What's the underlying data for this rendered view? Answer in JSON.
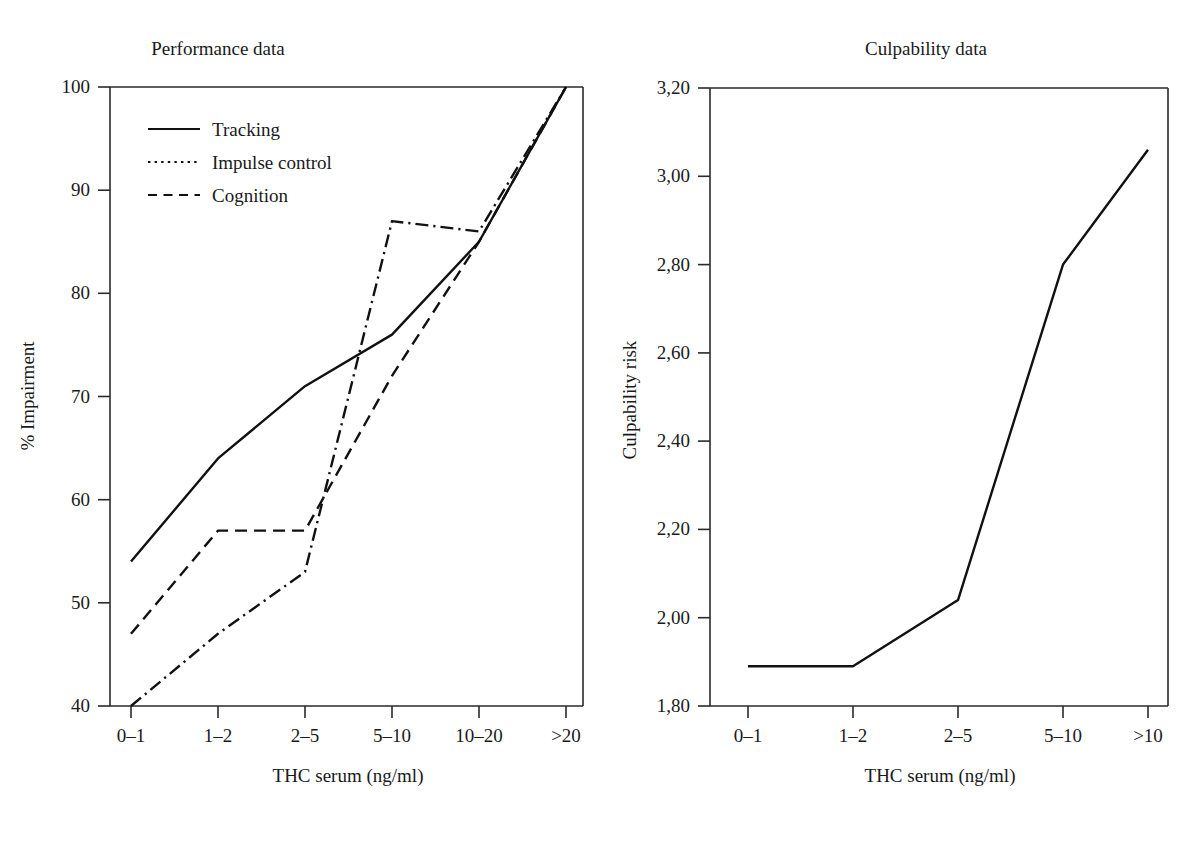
{
  "figure": {
    "cutoff_caption": "",
    "panels": [
      {
        "id": "performance",
        "title": "Performance data",
        "xlabel": "THC serum (ng/ml)",
        "ylabel": "% Impairment"
      },
      {
        "id": "culpability",
        "title": "Culpability data",
        "xlabel": "THC serum (ng/ml)",
        "ylabel": "Culpability risk"
      }
    ]
  },
  "legend": {
    "items": [
      {
        "label": "Tracking",
        "style": "solid"
      },
      {
        "label": "Impulse control",
        "style": "dotted"
      },
      {
        "label": "Cognition",
        "style": "dashed"
      }
    ]
  },
  "left_axis": {
    "y_ticks": [
      "40",
      "50",
      "60",
      "70",
      "80",
      "90",
      "100"
    ],
    "x_ticks": [
      "0–1",
      "1–2",
      "2–5",
      "5–10",
      "10–20",
      ">20"
    ]
  },
  "right_axis": {
    "y_ticks": [
      "1,80",
      "2,00",
      "2,20",
      "2,40",
      "2,60",
      "2,80",
      "3,00",
      "3,20"
    ],
    "x_ticks": [
      "0–1",
      "1–2",
      "2–5",
      "5–10",
      ">10"
    ]
  },
  "chart_data": [
    {
      "type": "line",
      "title": "Performance data",
      "xlabel": "THC serum (ng/ml)",
      "ylabel": "% Impairment",
      "categories": [
        "0–1",
        "1–2",
        "2–5",
        "5–10",
        "10–20",
        ">20"
      ],
      "ylim": [
        40,
        100
      ],
      "yticks": [
        40,
        50,
        60,
        70,
        80,
        90,
        100
      ],
      "grid": false,
      "legend_position": "upper-left-inside",
      "series": [
        {
          "name": "Tracking",
          "style": "solid",
          "values": [
            54,
            64,
            71,
            76,
            85,
            100
          ]
        },
        {
          "name": "Impulse control",
          "style": "dotted",
          "values": [
            40,
            47,
            53,
            87,
            86,
            100
          ]
        },
        {
          "name": "Cognition",
          "style": "dashed",
          "values": [
            47,
            57,
            57,
            72,
            85,
            100
          ]
        }
      ]
    },
    {
      "type": "line",
      "title": "Culpability data",
      "xlabel": "THC serum (ng/ml)",
      "ylabel": "Culpability risk",
      "categories": [
        "0–1",
        "1–2",
        "2–5",
        "5–10",
        ">10"
      ],
      "ylim": [
        1.8,
        3.2
      ],
      "yticks": [
        1.8,
        2.0,
        2.2,
        2.4,
        2.6,
        2.8,
        3.0,
        3.2
      ],
      "grid": false,
      "series": [
        {
          "name": "Culpability risk",
          "style": "solid",
          "values": [
            1.89,
            1.89,
            2.04,
            2.8,
            3.06
          ]
        }
      ]
    }
  ],
  "colors": {
    "line": "#111111",
    "axis": "#2a2a2a",
    "text": "#1a1a1a",
    "background": "#ffffff"
  }
}
